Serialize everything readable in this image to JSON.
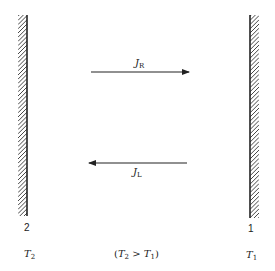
{
  "diagram": {
    "walls": [
      {
        "id": "wall-2",
        "number": "2",
        "temperature_symbol": "T",
        "temperature_sub": "2",
        "hatch_side": "left"
      },
      {
        "id": "wall-1",
        "number": "1",
        "temperature_symbol": "T",
        "temperature_sub": "1",
        "hatch_side": "right"
      }
    ],
    "arrows": [
      {
        "id": "flux-right",
        "symbol": "J",
        "sub": "R",
        "direction": "right"
      },
      {
        "id": "flux-left",
        "symbol": "J",
        "sub": "L",
        "direction": "left"
      }
    ],
    "condition": {
      "open": "(",
      "lhs": "T",
      "lhs_sub": "2",
      "op": " > ",
      "rhs": "T",
      "rhs_sub": "1",
      "close": ")"
    },
    "colors": {
      "ink": "#222222",
      "background": "#ffffff"
    }
  }
}
